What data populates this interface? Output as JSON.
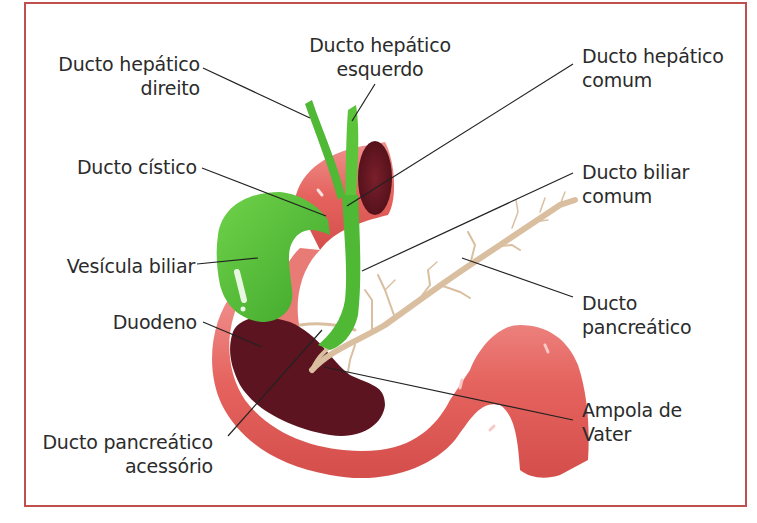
{
  "figure": {
    "frame_color": "#c0504d",
    "colors": {
      "bile_ducts": "#5cc43a",
      "duodenum": "#e5635e",
      "duodenum_highlight": "#f2a3a0",
      "duodenum_lumen": "#6b1a24",
      "pancreatic_duct": "#d9bfa0",
      "leader_lines": "#222222",
      "label_text": "#2b2b2b"
    }
  },
  "labels": {
    "ducto_hepatico_direito": [
      "Ducto hepático",
      "direito"
    ],
    "ducto_hepatico_esquerdo": [
      "Ducto hepático",
      "esquerdo"
    ],
    "ducto_hepatico_comum": [
      "Ducto hepático",
      "comum"
    ],
    "ducto_cistico": [
      "Ducto cístico"
    ],
    "ducto_biliar_comum": [
      "Ducto biliar",
      "comum"
    ],
    "vesicula_biliar": [
      "Vesícula biliar"
    ],
    "ducto_pancreatico": [
      "Ducto",
      "pancreático"
    ],
    "duodeno": [
      "Duodeno"
    ],
    "ampola_de_vater": [
      "Ampola de",
      "Vater"
    ],
    "ducto_pancreatico_acessorio": [
      "Ducto pancreático",
      "acessório"
    ]
  }
}
